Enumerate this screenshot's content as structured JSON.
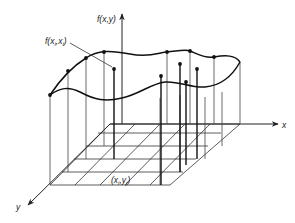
{
  "diagram": {
    "labels": {
      "z_axis": "f(x,y)",
      "x_axis": "x",
      "y_axis": "y",
      "sample_value_prefix": "f(x",
      "sample_value_sub1": "i",
      "sample_value_mid": ",x",
      "sample_value_sub2": "i",
      "sample_value_suffix": ")",
      "grid_point_prefix": "(x",
      "grid_point_sub1": "i",
      "grid_point_mid": ",y",
      "grid_point_sub2": "j",
      "grid_point_suffix": ")"
    },
    "colors": {
      "line": "#222222",
      "thin_line": "#555555",
      "background": "#ffffff"
    }
  }
}
